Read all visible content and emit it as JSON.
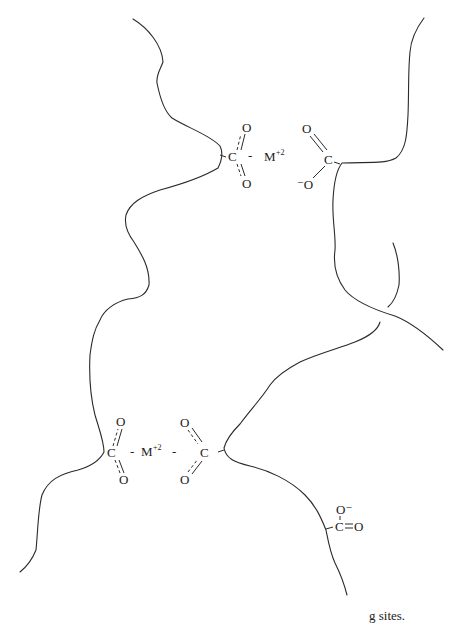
{
  "figure": {
    "type": "chemical-diagram",
    "caption_fragment": "g sites."
  },
  "labels": {
    "carbon": "C",
    "oxygen": "O",
    "metal": "M",
    "metal_charge": "+2",
    "neg_oxygen": "⁻O",
    "neg_oxygen_right": "O⁻",
    "dash": "-"
  },
  "groups": [
    {
      "id": "top-bridge-left-carboxylate",
      "position": [
        228,
        157
      ],
      "bonding": "delocalized (dashed double bonds)"
    },
    {
      "id": "top-metal-ion",
      "label": "M+2",
      "position": [
        264,
        157
      ]
    },
    {
      "id": "top-bridge-right-carboxylate",
      "position": [
        328,
        160
      ],
      "bonding": "C=O and C-O⁻"
    },
    {
      "id": "bottom-bridge-left-carboxylate",
      "position": [
        113,
        453
      ],
      "bonding": "delocalized"
    },
    {
      "id": "bottom-metal-ion",
      "label": "M+2",
      "position": [
        150,
        450
      ]
    },
    {
      "id": "bottom-bridge-right-carboxylate",
      "position": [
        202,
        453
      ],
      "bonding": "delocalized"
    },
    {
      "id": "free-carboxylate",
      "position": [
        340,
        524
      ],
      "bonding": "C=O and C-O⁻"
    }
  ],
  "colors": {
    "line": "#2a2a2a",
    "text": "#222222",
    "background": "#ffffff"
  }
}
